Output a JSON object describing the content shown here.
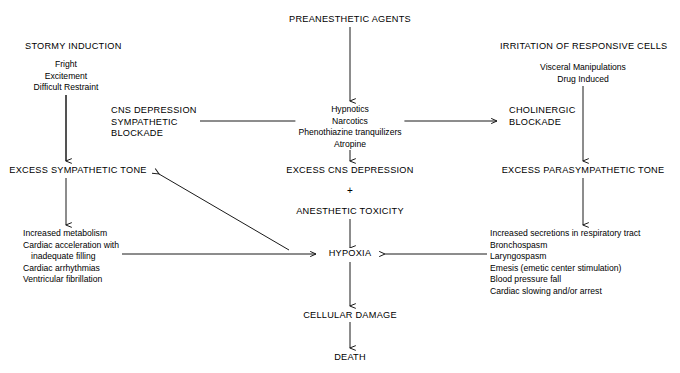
{
  "diagram": {
    "background_color": "#ffffff",
    "line_color": "#1a1a1a",
    "text_color": "#000000"
  },
  "nodes": {
    "preanesthetic_agents": "PREANESTHETIC AGENTS",
    "stormy_induction": "STORMY INDUCTION",
    "stormy_induction_items": [
      "Fright",
      "Excitement",
      "Difficult Restraint"
    ],
    "irritation_responsive_cells": "IRRITATION OF RESPONSIVE CELLS",
    "irritation_items": [
      "Visceral Manipulations",
      "Drug Induced"
    ],
    "cns_depression_block": [
      "CNS DEPRESSION",
      "SYMPATHETIC",
      "BLOCKADE"
    ],
    "agents_list": [
      "Hypnotics",
      "Narcotics",
      "Phenothiazine tranquilizers",
      "Atropine"
    ],
    "cholinergic_block": [
      "CHOLINERGIC",
      "BLOCKADE"
    ],
    "excess_sympathetic_tone": "EXCESS SYMPATHETIC TONE",
    "excess_cns_depression": "EXCESS CNS DEPRESSION",
    "excess_parasympathetic_tone": "EXCESS PARASYMPATHETIC TONE",
    "plus_sign": "+",
    "anesthetic_toxicity": "ANESTHETIC TOXICITY",
    "sympathetic_effects": [
      "Increased metabolism",
      "Cardiac acceleration with",
      "inadequate filling",
      "Cardiac arrhythmias",
      "Ventricular fibrillation"
    ],
    "parasympathetic_effects": [
      "Increased secretions in respiratory tract",
      "Bronchospasm",
      "Laryngospasm",
      "Emesis (emetic center stimulation)",
      "Blood pressure fall",
      "Cardiac slowing and/or arrest"
    ],
    "hypoxia": "HYPOXIA",
    "cellular_damage": "CELLULAR DAMAGE",
    "death": "DEATH"
  }
}
